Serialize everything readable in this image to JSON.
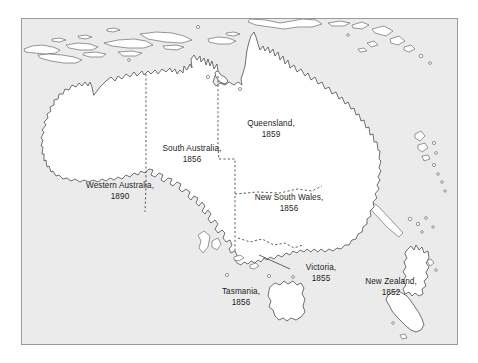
{
  "figure": {
    "kind": "reference-map",
    "frame_color": "#9a9a9a",
    "sea_color": "#ebebeb",
    "land_color": "#ffffff",
    "coast_color": "#4c4c4c",
    "border_color": "#3d3d3d",
    "text_color": "#1c1c1c"
  },
  "labels": [
    {
      "id": "western-australia",
      "name": "Western Australia,",
      "year": "1890",
      "x": 98,
      "y": 168
    },
    {
      "id": "south-australia",
      "name": "South Australia,",
      "year": "1856",
      "x": 170,
      "y": 150
    },
    {
      "id": "queensland",
      "name": "Queensland,",
      "year": "1859",
      "x": 249,
      "y": 126
    },
    {
      "id": "new-south-wales",
      "name": "New South Wales,",
      "year": "1856",
      "x": 267,
      "y": 196
    },
    {
      "id": "victoria",
      "name": "Victoria,",
      "year": "1855",
      "x": 299,
      "y": 258
    },
    {
      "id": "tasmania",
      "name": "Tasmania,",
      "year": "1856",
      "x": 234,
      "y": 283
    },
    {
      "id": "new-zealand",
      "name": "New Zealand,",
      "year": "1852",
      "x": 391,
      "y": 277
    }
  ],
  "landmasses": [
    {
      "id": "australia-mainland",
      "label": "Australia mainland"
    },
    {
      "id": "tasmania-island",
      "label": "Tasmania"
    },
    {
      "id": "new-zealand-north-island",
      "label": "New Zealand North Island"
    },
    {
      "id": "new-zealand-south-island",
      "label": "New Zealand South Island"
    },
    {
      "id": "new-guinea",
      "label": "New Guinea"
    },
    {
      "id": "indonesian-archipelago",
      "label": "Indonesian archipelago"
    },
    {
      "id": "melanesian-islands",
      "label": "Melanesian islands"
    }
  ],
  "state_borders": [
    {
      "id": "wa-sa-nt-border",
      "label": "Western Australia eastern border"
    },
    {
      "id": "nt-sa-border",
      "label": "Northern Territory / South Australia border"
    },
    {
      "id": "sa-qld-nsw-border",
      "label": "South Australia eastern border"
    },
    {
      "id": "qld-nsw-border",
      "label": "Queensland / New South Wales border"
    },
    {
      "id": "nsw-vic-border",
      "label": "New South Wales / Victoria border"
    }
  ]
}
